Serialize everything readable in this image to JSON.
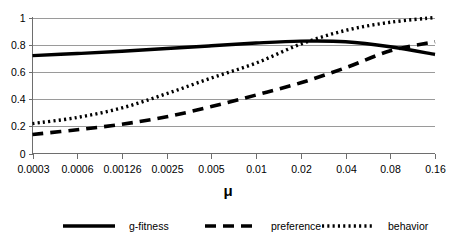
{
  "chart_data": {
    "type": "line",
    "title": "",
    "xlabel": "μ",
    "ylabel": "",
    "x_tick_labels": [
      "0.0003",
      "0.0006",
      "0.00126",
      "0.0025",
      "0.005",
      "0.01",
      "0.02",
      "0.04",
      "0.08",
      "0.16"
    ],
    "y_tick_labels": [
      "0",
      "0.2",
      "0.4",
      "0.6",
      "0.8",
      "1"
    ],
    "y_tick_values": [
      0,
      0.2,
      0.4,
      0.6,
      0.8,
      1
    ],
    "ylim": [
      0,
      1
    ],
    "x_scale": "categorical-log",
    "grid": "horizontal",
    "legend_position": "bottom",
    "series": [
      {
        "name": "g-fitness",
        "style": "solid",
        "values": [
          0.72,
          0.735,
          0.752,
          0.772,
          0.792,
          0.812,
          0.826,
          0.822,
          0.785,
          0.728
        ]
      },
      {
        "name": "preference",
        "style": "dashed",
        "values": [
          0.14,
          0.175,
          0.215,
          0.27,
          0.345,
          0.43,
          0.52,
          0.63,
          0.755,
          0.822
        ]
      },
      {
        "name": "behavior",
        "style": "dotted",
        "values": [
          0.22,
          0.265,
          0.335,
          0.44,
          0.555,
          0.665,
          0.805,
          0.905,
          0.965,
          1.0
        ]
      }
    ]
  },
  "legend": {
    "items": [
      {
        "label": "g-fitness",
        "style": "solid"
      },
      {
        "label": "preference",
        "style": "dashed"
      },
      {
        "label": "behavior",
        "style": "dotted"
      }
    ]
  },
  "colors": {
    "series": "#000000",
    "grid": "#9a9a9a",
    "axis": "#6e6e6e",
    "background": "#ffffff"
  }
}
